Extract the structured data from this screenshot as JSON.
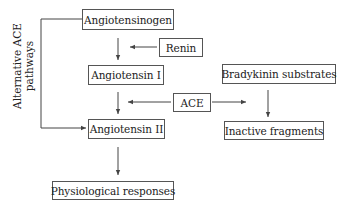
{
  "diagram": {
    "nodes": {
      "angiotensinogen": "Angiotensinogen",
      "renin": "Renin",
      "angiotensin_i": "Angiotensin I",
      "ace": "ACE",
      "angiotensin_ii": "Angiotensin II",
      "physiological_responses": "Physiological responses",
      "bradykinin_substrates": "Bradykinin substrates",
      "inactive_fragments": "Inactive fragments"
    },
    "side_label": {
      "line1": "Alternative ACE",
      "line2": "pathways"
    },
    "edges": [
      {
        "from": "angiotensinogen",
        "to": "angiotensin_i"
      },
      {
        "from": "renin",
        "to": "angiotensinogen-to-angiotensin_i"
      },
      {
        "from": "angiotensin_i",
        "to": "angiotensin_ii"
      },
      {
        "from": "ace",
        "to": "angiotensin_i-to-angiotensin_ii"
      },
      {
        "from": "ace",
        "to": "bradykinin-to-inactive"
      },
      {
        "from": "bradykinin_substrates",
        "to": "inactive_fragments"
      },
      {
        "from": "angiotensin_ii",
        "to": "physiological_responses"
      },
      {
        "from": "angiotensinogen",
        "to": "angiotensin_ii",
        "label": "Alternative ACE pathways"
      }
    ],
    "colors": {
      "line": "#444444",
      "border": "#555555",
      "text": "#222222"
    }
  }
}
